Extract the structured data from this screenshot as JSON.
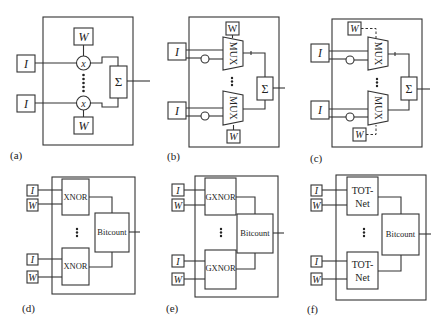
{
  "diagram": {
    "panels": [
      {
        "id": "a",
        "label": "(a)",
        "input": "I",
        "weight": "W",
        "op": "x",
        "sum": "Σ"
      },
      {
        "id": "b",
        "label": "(b)",
        "input": "I",
        "weight": "W",
        "op": "MUX",
        "sum": "Σ"
      },
      {
        "id": "c",
        "label": "(c)",
        "input": "I",
        "weight": "W",
        "op": "MUX",
        "sum": "Σ"
      },
      {
        "id": "d",
        "label": "(d)",
        "input": "I",
        "weight": "W",
        "op": "XNOR",
        "sum": "Bitcount"
      },
      {
        "id": "e",
        "label": "(e)",
        "input": "I",
        "weight": "W",
        "op": "GXNOR",
        "sum": "Bitcount"
      },
      {
        "id": "f",
        "label": "(f)",
        "input": "I",
        "weight": "W",
        "op_line1": "TOT-",
        "op_line2": "Net",
        "sum": "Bitcount"
      }
    ],
    "colors": {
      "stroke": "#333333",
      "background": "#ffffff",
      "text": "#222222"
    }
  }
}
